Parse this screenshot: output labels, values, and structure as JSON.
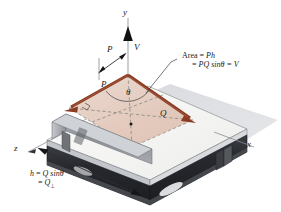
{
  "figure": {
    "type": "engineering-vector-diagram",
    "background_color": "#ffffff"
  },
  "axes": {
    "y_label": "y",
    "x_label": "x",
    "z_label": "z"
  },
  "vectors": {
    "p_top_label": "P",
    "p_plane_label": "P",
    "q_label": "Q",
    "v_label": "V",
    "angle_label": "θ"
  },
  "annotations": {
    "area_line1": "Area = Ph",
    "area_line2": "= PQ sinθ = V",
    "area_line1_prefix": "Area = ",
    "area_line1_value": "Ph",
    "area_line2_prefix": "= ",
    "area_line2_value": "PQ sin",
    "area_line2_theta": "θ",
    "area_line2_suffix": " = V",
    "height_line1_lhs": "h",
    "height_line1_eq": " = ",
    "height_line1_rhs": "Q sin",
    "height_line1_theta": "θ",
    "height_line2_eq": "= ",
    "height_line2_rhs": "Q",
    "height_line2_sub": "⊥"
  },
  "colors": {
    "vector_brown": "#8a3b23",
    "vector_brown_light": "#a8502f",
    "vector_black": "#111111",
    "plate_top": "#f2f2f0",
    "plate_shadow": "#d9dade",
    "beam_dark": "#2b2d32",
    "beam_gray": "#9a9da2",
    "parallelogram_fill": "#e6cfc4",
    "axis_gray": "#6f7378",
    "dashed_gray": "#6b6e73",
    "text": "#1a1a1a"
  }
}
